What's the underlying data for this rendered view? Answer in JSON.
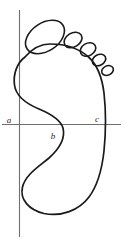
{
  "figure": {
    "background_color": "#ffffff",
    "outline_color": "#1a1a1a",
    "axis_color": "#6f6f6f",
    "label_color": "#2a2a2a",
    "labels": [
      {
        "id": "a",
        "text": "a",
        "x": 11,
        "y": 122,
        "note": "left end of horizontal axis"
      },
      {
        "id": "b",
        "text": "b",
        "x": 52,
        "y": 138,
        "note": "below axis near arch curve"
      },
      {
        "id": "c",
        "text": "c",
        "x": 96,
        "y": 122,
        "note": "above axis at right outline crossing"
      }
    ],
    "axes": {
      "horizontal": {
        "x1": 2,
        "y1": 124.5,
        "x2": 121,
        "y2": 124.5
      },
      "vertical": {
        "x1": 19.5,
        "y1": 10,
        "x2": 19.5,
        "y2": 237
      }
    },
    "toes": [
      {
        "name": "big-toe",
        "cx": 45,
        "cy": 37,
        "rx": 21,
        "ry": 14,
        "rotate": -34
      },
      {
        "name": "second-toe",
        "cx": 73,
        "cy": 40,
        "rx": 9.5,
        "ry": 7,
        "rotate": -32
      },
      {
        "name": "third-toe",
        "cx": 88,
        "cy": 49,
        "rx": 8.2,
        "ry": 6.2,
        "rotate": -30
      },
      {
        "name": "fourth-toe",
        "cx": 99,
        "cy": 59,
        "rx": 7.2,
        "ry": 5.4,
        "rotate": -28
      },
      {
        "name": "fifth-toe",
        "cx": 107,
        "cy": 70,
        "rx": 6.2,
        "ry": 4.6,
        "rotate": -26
      }
    ],
    "sole_outline_path": "M 24 60 C 18 64 14 74 15 84 C 16 96 26 103 38 108 C 50 113 60 118 63 127 C 66 137 60 148 50 157 C 38 167 26 174 23 186 C 20 198 28 209 43 213 C 60 217 78 211 88 198 C 97 186 101 170 103 152 C 105 132 105 112 103 94 C 101 78 97 66 88 58 C 78 49 64 45 50 45 C 38 45 30 50 24 60 Z"
  }
}
